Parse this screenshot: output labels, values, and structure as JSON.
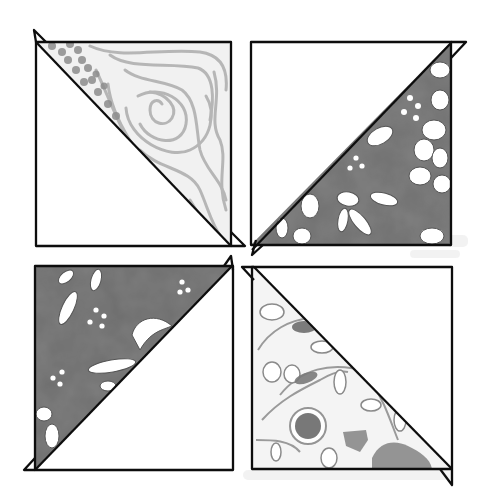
{
  "colors": {
    "background": "#ffffff",
    "outline": "#111111",
    "light_fabric_base": "#eeeeee",
    "light_fabric_pattern": "#a9a9a9",
    "dark_fabric": "#6f6f6f",
    "dark_fabric_shadow": "#5a5a5a",
    "floral_accent": "#7a7a7a",
    "plain_fabric": "#ffffff"
  },
  "blocks": [
    {
      "position": "top-left",
      "pattern": "swirl-and-dot print",
      "diagonal": "top-left to bottom-right",
      "patterned_side": "upper-right"
    },
    {
      "position": "top-right",
      "pattern": "dark floral batik",
      "diagonal": "bottom-left to top-right",
      "patterned_side": "lower-right"
    },
    {
      "position": "bottom-left",
      "pattern": "dark floral batik",
      "diagonal": "bottom-left to top-right",
      "patterned_side": "upper-left"
    },
    {
      "position": "bottom-right",
      "pattern": "light floral vine print",
      "diagonal": "top-left to bottom-right",
      "patterned_side": "lower-left"
    }
  ]
}
